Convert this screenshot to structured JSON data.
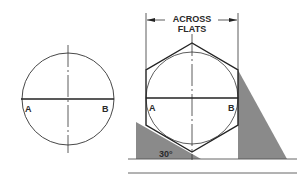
{
  "diagram": {
    "title_label_line1": "ACROSS",
    "title_label_line2": "FLATS",
    "left_figure": {
      "point_a": "A",
      "point_b": "B"
    },
    "right_figure": {
      "point_a": "A",
      "point_b": "B",
      "angle_label": "30°"
    },
    "colors": {
      "line": "#222222",
      "triangle_fill": "#8a8a8a",
      "background": "#ffffff"
    }
  }
}
